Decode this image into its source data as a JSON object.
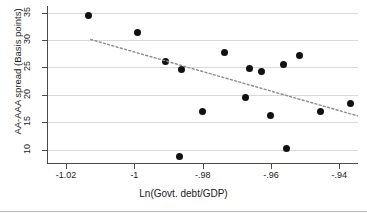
{
  "chart_data": {
    "type": "scatter",
    "title": "",
    "xlabel": "Ln(Govt. debt/GDP)",
    "ylabel": "AA-AAA spread (Basis points)",
    "xlim": [
      -1.0256,
      -0.9345
    ],
    "ylim": [
      7.6,
      36.2
    ],
    "grid": true,
    "legend": "none",
    "xticks": [
      -1.02,
      -1,
      -0.98,
      -0.96,
      -0.94
    ],
    "xtick_labels": [
      "-1.02",
      "-1",
      "-.98",
      "-.96",
      "-.94"
    ],
    "yticks": [
      10,
      15,
      20,
      25,
      30,
      35
    ],
    "ytick_labels": [
      "10",
      "15",
      "20",
      "25",
      "30",
      "35"
    ],
    "points": [
      {
        "x": -1.0133,
        "y": 34.5
      },
      {
        "x": -0.9992,
        "y": 31.4
      },
      {
        "x": -0.9908,
        "y": 26.1
      },
      {
        "x": -0.9861,
        "y": 24.7
      },
      {
        "x": -0.9867,
        "y": 8.8
      },
      {
        "x": -0.98,
        "y": 16.9
      },
      {
        "x": -0.9735,
        "y": 27.7
      },
      {
        "x": -0.9663,
        "y": 24.8
      },
      {
        "x": -0.9627,
        "y": 24.2
      },
      {
        "x": -0.9674,
        "y": 19.6
      },
      {
        "x": -0.96,
        "y": 16.3
      },
      {
        "x": -0.9564,
        "y": 25.6
      },
      {
        "x": -0.9517,
        "y": 27.2
      },
      {
        "x": -0.9555,
        "y": 10.2
      },
      {
        "x": -0.9456,
        "y": 16.9
      },
      {
        "x": -0.9367,
        "y": 18.5
      }
    ],
    "trendline": {
      "style": "dotted",
      "color": "#8c8c8c",
      "x_start": -1.0128,
      "y_start": 30.1,
      "x_end": -0.9347,
      "y_end": 16.2
    }
  },
  "axes": {
    "y_title": "AA-AAA spread (Basis points)",
    "x_title": "Ln(Govt. debt/GDP)"
  }
}
